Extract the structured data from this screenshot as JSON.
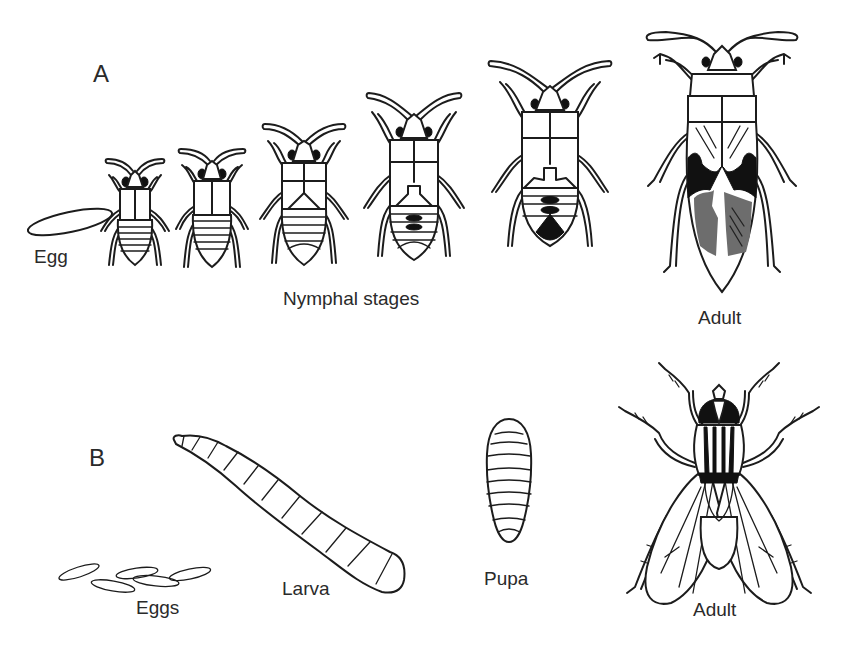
{
  "figure": {
    "panels": [
      {
        "id": "A",
        "letter": "A",
        "type": "incomplete metamorphosis",
        "stages": [
          {
            "label": "Egg"
          },
          {
            "label": "Nymphal stages",
            "count": 5
          },
          {
            "label": "Adult"
          }
        ]
      },
      {
        "id": "B",
        "letter": "B",
        "type": "complete metamorphosis",
        "stages": [
          {
            "label": "Eggs"
          },
          {
            "label": "Larva"
          },
          {
            "label": "Pupa"
          },
          {
            "label": "Adult"
          }
        ]
      }
    ],
    "colors": {
      "ink": "#1c1c1c",
      "background": "#ffffff",
      "wing_shading": "#6d6d6d",
      "dark_markings": "#111111"
    }
  }
}
